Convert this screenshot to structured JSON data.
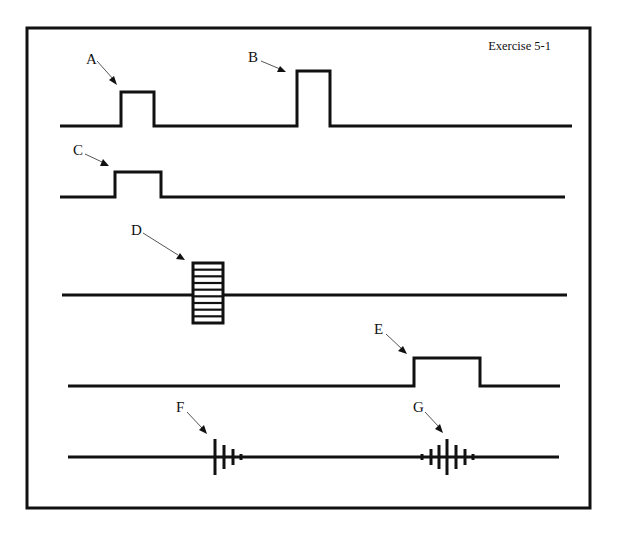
{
  "title": "Exercise 5-1",
  "colors": {
    "ink": "#111111",
    "background": "#ffffff",
    "leader": "#555555"
  },
  "labels": {
    "A": "A",
    "B": "B",
    "C": "C",
    "D": "D",
    "E": "E",
    "F": "F",
    "G": "G"
  },
  "rows": [
    {
      "id": "row-ab",
      "baseline_y": 126,
      "x_start": 60,
      "x_end": 572,
      "pulses": [
        {
          "label": "A",
          "x1": 121,
          "x2": 154,
          "top_y": 92
        },
        {
          "label": "B",
          "x1": 297,
          "x2": 330,
          "top_y": 71
        }
      ]
    },
    {
      "id": "row-c",
      "baseline_y": 197,
      "x_start": 60,
      "x_end": 565,
      "pulses": [
        {
          "label": "C",
          "x1": 115,
          "x2": 161,
          "top_y": 172
        }
      ]
    },
    {
      "id": "row-d",
      "baseline_y": 295,
      "x_start": 62,
      "x_end": 567,
      "ladder": {
        "label": "D",
        "x1": 193,
        "x2": 223,
        "y1": 263,
        "y2": 323,
        "rungs": 9
      }
    },
    {
      "id": "row-e",
      "baseline_y": 386,
      "x_start": 68,
      "x_end": 560,
      "pulses": [
        {
          "label": "E",
          "x1": 414,
          "x2": 480,
          "top_y": 358
        }
      ]
    },
    {
      "id": "row-fg",
      "baseline_y": 457,
      "x_start": 68,
      "x_end": 559,
      "spike_trains": [
        {
          "label": "F",
          "spikes": [
            {
              "x": 215,
              "h": 18
            },
            {
              "x": 224,
              "h": 12
            },
            {
              "x": 233,
              "h": 8
            },
            {
              "x": 241,
              "h": 3
            }
          ]
        },
        {
          "label": "G",
          "spikes": [
            {
              "x": 422,
              "h": 3
            },
            {
              "x": 431,
              "h": 8
            },
            {
              "x": 439,
              "h": 12
            },
            {
              "x": 447,
              "h": 18
            },
            {
              "x": 456,
              "h": 12
            },
            {
              "x": 465,
              "h": 8
            },
            {
              "x": 473,
              "h": 3
            }
          ]
        }
      ]
    }
  ]
}
